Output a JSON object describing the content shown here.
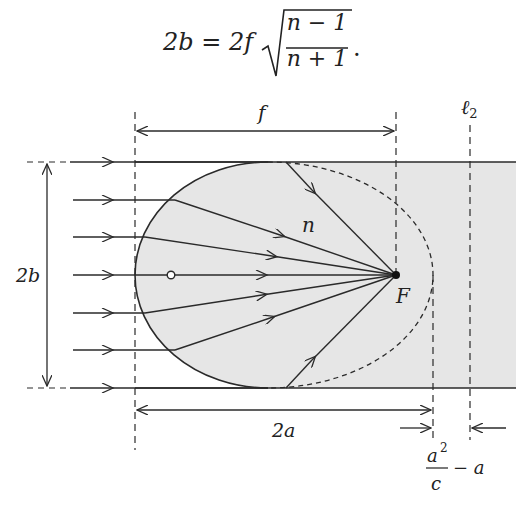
{
  "formula": {
    "lhs": "2b",
    "equals": "=",
    "coefficient": "2f",
    "numerator": "n − 1",
    "denominator": "n + 1",
    "trailing": ".",
    "latex": "2b = 2f\\sqrt{\\frac{n-1}{n+1}}."
  },
  "diagram": {
    "labels": {
      "f": "f",
      "n": "n",
      "F": "F",
      "ell2": "ℓ",
      "ell2_sub": "2",
      "two_b": "2b",
      "two_a": "2a",
      "a_sq_num": "a",
      "a_sq_exp": "2",
      "c_den": "c",
      "minus_a": "− a"
    },
    "colors": {
      "medium_fill": "#e6e6e6",
      "line": "#2a2a2a",
      "background": "#ffffff"
    },
    "elements": {
      "incident_rays_count": 7,
      "lens_shape": "ellipsoidal front surface",
      "focus_marker": "filled dot",
      "center_marker": "open circle"
    }
  }
}
